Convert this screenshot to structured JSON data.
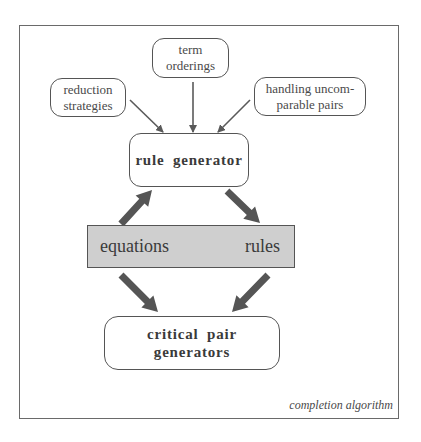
{
  "diagram": {
    "title": "completion algorithm",
    "inputs": [
      {
        "id": "reduction",
        "lines": [
          "reduction",
          "strategies"
        ]
      },
      {
        "id": "term",
        "lines": [
          "term",
          "orderings"
        ]
      },
      {
        "id": "handling",
        "lines": [
          "handling uncom-",
          "parable pairs"
        ]
      }
    ],
    "rule_generator": {
      "label": "rule generator"
    },
    "store": {
      "left_label": "equations",
      "right_label": "rules"
    },
    "critical_pair": {
      "label": "critical pair generators"
    },
    "edges": [
      {
        "from": "reduction strategies",
        "to": "rule generator",
        "style": "thin"
      },
      {
        "from": "term orderings",
        "to": "rule generator",
        "style": "thin"
      },
      {
        "from": "handling uncomparable pairs",
        "to": "rule generator",
        "style": "thin"
      },
      {
        "from": "equations",
        "to": "rule generator",
        "style": "thick"
      },
      {
        "from": "rule generator",
        "to": "rules",
        "style": "thick"
      },
      {
        "from": "equations",
        "to": "critical pair generators",
        "style": "thick"
      },
      {
        "from": "rules",
        "to": "critical pair generators",
        "style": "thick"
      }
    ],
    "colors": {
      "store_fill": "#cfcfcf",
      "arrow_thick": "#555555",
      "arrow_thin": "#5a5a5a",
      "border": "#555555"
    }
  }
}
